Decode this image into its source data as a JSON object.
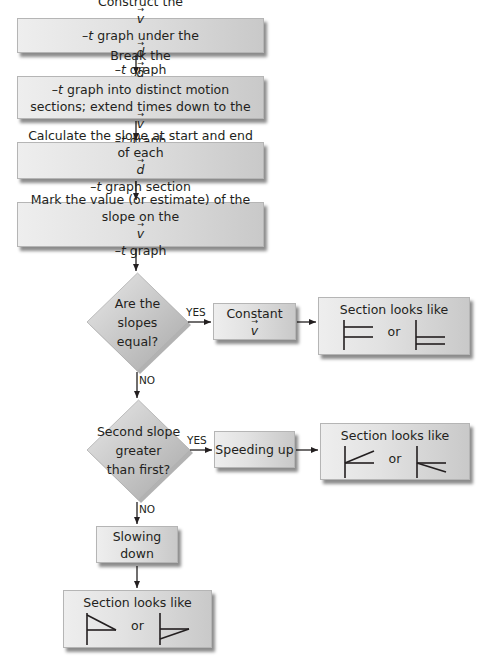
{
  "flowchart": {
    "steps": [
      {
        "id": "step1",
        "parts": [
          "Construct the ",
          "v",
          "–",
          "t",
          " graph under the ",
          "d",
          "–",
          "t",
          " graph"
        ]
      },
      {
        "id": "step2",
        "line1_parts": [
          "Break the ",
          "d",
          "–",
          "t",
          " graph into distinct motion"
        ],
        "line2_parts": [
          "sections; extend times down to the ",
          "v",
          "–",
          "t",
          " graph"
        ]
      },
      {
        "id": "step3",
        "line1": "Calculate the slope at start and end",
        "line2_parts": [
          "of each ",
          "d",
          "–",
          "t",
          " graph section"
        ]
      },
      {
        "id": "step4",
        "line1": "Mark the value (or estimate) of the",
        "line2_parts": [
          "slope on the ",
          "v",
          "–",
          "t",
          " graph"
        ]
      }
    ],
    "decisions": [
      {
        "id": "decision1",
        "lines": [
          "Are the",
          "slopes",
          "equal?"
        ],
        "yes_label": "YES",
        "no_label": "NO"
      },
      {
        "id": "decision2",
        "lines": [
          "Second slope",
          "greater",
          "than first?"
        ],
        "yes_label": "YES",
        "no_label": "NO"
      }
    ],
    "outcomes": [
      {
        "id": "constant",
        "label": "Constant ",
        "vector": "v"
      },
      {
        "id": "speeding",
        "label": "Speeding up"
      },
      {
        "id": "slowing",
        "label": "Slowing down"
      }
    ],
    "sections": [
      {
        "id": "section-constant",
        "title": "Section looks like",
        "or": "or",
        "shapes": [
          "horizontal-positive",
          "horizontal-negative"
        ]
      },
      {
        "id": "section-speeding",
        "title": "Section looks like",
        "or": "or",
        "shapes": [
          "rising-positive",
          "falling-negative"
        ]
      },
      {
        "id": "section-slowing",
        "title": "Section looks like",
        "or": "or",
        "shapes": [
          "falling-positive",
          "rising-negative"
        ]
      }
    ]
  },
  "colors": {
    "box_light": "#eeeeee",
    "box_dark": "#c9c9c9",
    "line": "#231f20"
  }
}
